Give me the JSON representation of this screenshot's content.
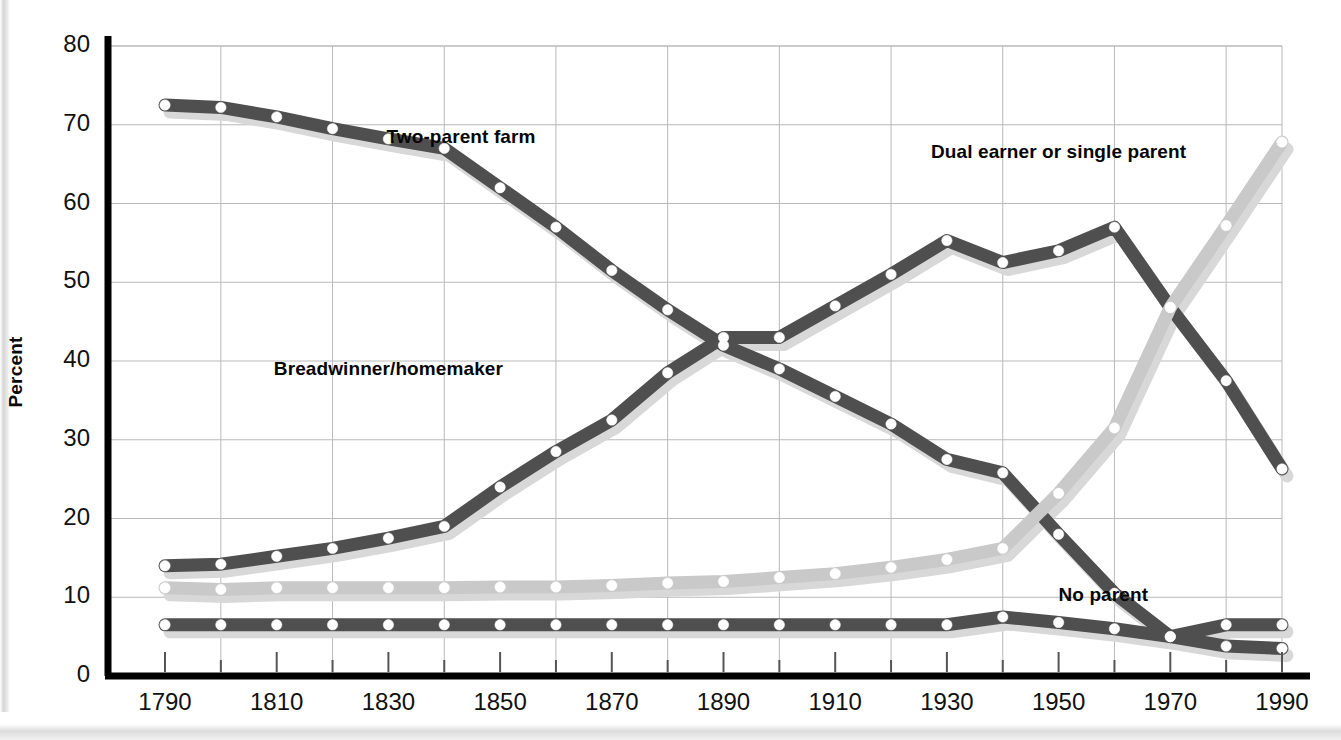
{
  "axes": {
    "ylabel": "Percent",
    "yticks": [
      "0",
      "10",
      "20",
      "30",
      "40",
      "50",
      "60",
      "70",
      "80"
    ],
    "xticks": [
      "1790",
      "1810",
      "1830",
      "1850",
      "1870",
      "1890",
      "1910",
      "1930",
      "1950",
      "1970",
      "1990"
    ]
  },
  "colors": {
    "dark_series": "#4f4f4f",
    "light_series": "#c9c9c9",
    "shadow": "#d8d8d8",
    "axis": "#000000",
    "grid": "#b9b9b9",
    "marker_fill": "#ffffff",
    "text": "#111111",
    "background": "#ffffff"
  },
  "series_labels": {
    "two_parent_farm": "Two-parent farm",
    "breadwinner_homemaker": "Breadwinner/homemaker",
    "dual_earner_single_parent": "Dual earner or single parent",
    "no_parent": "No parent"
  },
  "chart_data": {
    "type": "line",
    "title": "",
    "xlabel": "",
    "ylabel": "Percent",
    "xlim": [
      1790,
      1990
    ],
    "ylim": [
      0,
      80
    ],
    "grid": true,
    "legend": "inline-annotations",
    "x": [
      1790,
      1800,
      1810,
      1820,
      1830,
      1840,
      1850,
      1860,
      1870,
      1880,
      1890,
      1900,
      1910,
      1920,
      1930,
      1940,
      1950,
      1960,
      1970,
      1980,
      1990
    ],
    "series": [
      {
        "name": "Two-parent farm",
        "color": "#4f4f4f",
        "values": [
          72.5,
          72.2,
          71.0,
          69.5,
          68.2,
          67.0,
          62.0,
          57.0,
          51.5,
          46.5,
          42.0,
          39.0,
          35.5,
          32.0,
          27.5,
          25.8,
          18.0,
          10.5,
          5.0,
          3.8,
          3.5
        ]
      },
      {
        "name": "Breadwinner/homemaker",
        "color": "#4f4f4f",
        "values": [
          14.0,
          14.2,
          15.2,
          16.2,
          17.5,
          19.0,
          24.0,
          28.5,
          32.5,
          38.5,
          43.0,
          43.0,
          47.0,
          51.0,
          55.3,
          52.5,
          54.0,
          57.0,
          46.8,
          37.5,
          26.3
        ]
      },
      {
        "name": "Dual earner or single parent",
        "color": "#c9c9c9",
        "values": [
          11.2,
          11.0,
          11.2,
          11.2,
          11.2,
          11.2,
          11.3,
          11.3,
          11.5,
          11.8,
          12.0,
          12.5,
          13.0,
          13.8,
          14.8,
          16.2,
          23.2,
          31.5,
          46.8,
          57.2,
          67.8
        ]
      },
      {
        "name": "No parent",
        "color": "#4f4f4f",
        "values": [
          6.5,
          6.5,
          6.5,
          6.5,
          6.5,
          6.5,
          6.5,
          6.5,
          6.5,
          6.5,
          6.5,
          6.5,
          6.5,
          6.5,
          6.5,
          7.5,
          6.8,
          6.0,
          5.0,
          6.5,
          6.5
        ]
      }
    ],
    "annotations": [
      {
        "text": "Two-parent farm",
        "x": 1843,
        "y": 68.5
      },
      {
        "text": "Dual earner or single parent",
        "x": 1950,
        "y": 66.5
      },
      {
        "text": "Breadwinner/homemaker",
        "x": 1830,
        "y": 39.0
      },
      {
        "text": "No parent",
        "x": 1958,
        "y": 10.3
      }
    ]
  }
}
